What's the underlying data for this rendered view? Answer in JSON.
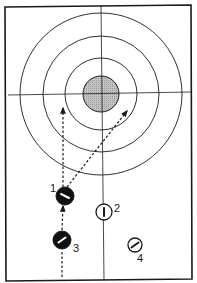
{
  "diagram": {
    "type": "curling-sheet",
    "colors": {
      "line": "#1a1a1a",
      "button_fill": "#bdbdbd",
      "dark_stone": "#111111",
      "light_stone": "#ffffff",
      "background": "#ffffff"
    },
    "house": {
      "center": [
        101,
        94
      ],
      "rings_radii": [
        81,
        58,
        36
      ],
      "button_radius": 18
    },
    "stones": [
      {
        "id": "1",
        "label": "1",
        "team": "dark",
        "x": 65,
        "y": 196,
        "r": 9,
        "label_x": 50,
        "label_y": 192
      },
      {
        "id": "2",
        "label": "2",
        "team": "light",
        "x": 104,
        "y": 212,
        "r": 8,
        "label_x": 114,
        "label_y": 212
      },
      {
        "id": "3",
        "label": "3",
        "team": "dark",
        "x": 62,
        "y": 240,
        "r": 9,
        "label_x": 73,
        "label_y": 252
      },
      {
        "id": "4",
        "label": "4",
        "team": "light",
        "x": 135,
        "y": 245,
        "r": 7,
        "label_x": 137,
        "label_y": 262
      }
    ],
    "paths": [
      {
        "name": "approach-path-stone-3",
        "from": [
          62,
          277
        ],
        "to": [
          62,
          251
        ],
        "arrow": false
      },
      {
        "name": "stone-3-to-stone-1",
        "from": [
          62,
          230
        ],
        "to": [
          63,
          206
        ],
        "arrow": true
      },
      {
        "name": "stone-1-straight-to-house",
        "from": [
          63,
          187
        ],
        "to": [
          63,
          108
        ],
        "arrow": true
      },
      {
        "name": "stone-1-diagonal-to-house",
        "from": [
          67,
          187
        ],
        "to": [
          127,
          111
        ],
        "arrow": true
      }
    ]
  }
}
